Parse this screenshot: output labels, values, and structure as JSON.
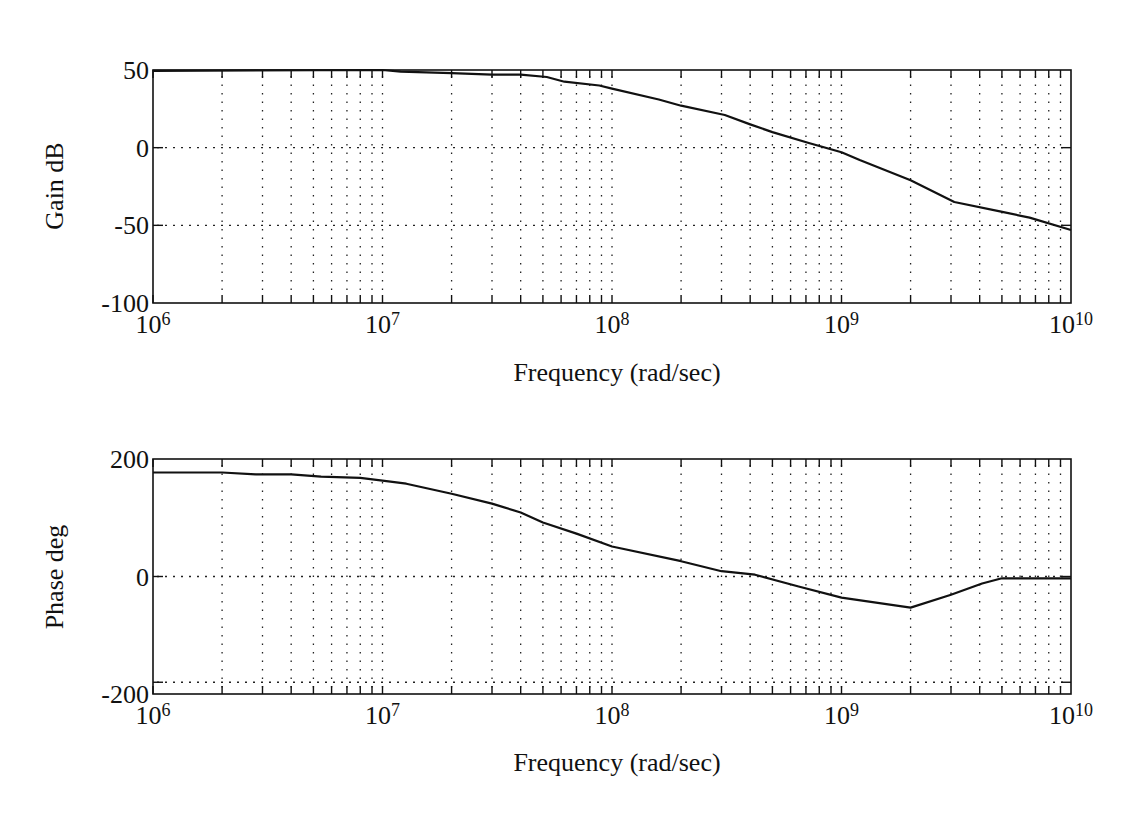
{
  "chart_data": [
    {
      "type": "line",
      "title": "",
      "xlabel": "Frequency (rad/sec)",
      "ylabel": "Gain dB",
      "xscale": "log",
      "xlim": [
        1000000,
        10000000000
      ],
      "ylim": [
        -100,
        50
      ],
      "xticks": [
        {
          "base": "10",
          "exp": "6"
        },
        {
          "base": "10",
          "exp": "7"
        },
        {
          "base": "10",
          "exp": "8"
        },
        {
          "base": "10",
          "exp": "9"
        },
        {
          "base": "10",
          "exp": "10"
        }
      ],
      "yticks": [
        "50",
        "0",
        "-50",
        "-100"
      ],
      "grid": true,
      "series": [
        {
          "name": "Gain",
          "x": [
            1000000.0,
            10000000.0,
            12000000.0,
            20000000.0,
            30000000.0,
            40000000.0,
            52000000.0,
            62000000.0,
            88000000.0,
            100000000.0,
            160000000.0,
            200000000.0,
            310000000.0,
            400000000.0,
            500000000.0,
            720000000.0,
            1000000000.0,
            1200000000.0,
            2000000000.0,
            3100000000.0,
            4900000000.0,
            6600000000.0,
            10000000000.0
          ],
          "values": [
            49.5,
            50,
            49,
            48,
            47,
            47,
            45.5,
            42.5,
            40,
            38,
            31,
            27,
            21,
            15,
            10,
            3,
            -3,
            -8,
            -21,
            -35,
            -41,
            -45,
            -53
          ]
        }
      ]
    },
    {
      "type": "line",
      "title": "",
      "xlabel": "Frequency (rad/sec)",
      "ylabel": "Phase deg",
      "xscale": "log",
      "xlim": [
        1000000,
        10000000000
      ],
      "ylim": [
        -200,
        200
      ],
      "xticks": [
        {
          "base": "10",
          "exp": "6"
        },
        {
          "base": "10",
          "exp": "7"
        },
        {
          "base": "10",
          "exp": "8"
        },
        {
          "base": "10",
          "exp": "9"
        },
        {
          "base": "10",
          "exp": "10"
        }
      ],
      "yticks": [
        "200",
        "0",
        "-200"
      ],
      "reference_lines": [
        0,
        -180
      ],
      "grid": true,
      "series": [
        {
          "name": "Phase",
          "x": [
            1000000.0,
            2000000.0,
            2800000.0,
            4000000.0,
            5400000.0,
            8000000.0,
            10000000.0,
            12700000.0,
            20000000.0,
            30000000.0,
            40000000.0,
            50000000.0,
            70000000.0,
            100000000.0,
            200000000.0,
            300000000.0,
            420000000.0,
            650000000.0,
            1000000000.0,
            2000000000.0,
            3000000000.0,
            4100000000.0,
            5000000000.0,
            10000000000.0
          ],
          "values": [
            177,
            177,
            174,
            174,
            170,
            168,
            163,
            158,
            141,
            124,
            109,
            92,
            73,
            51,
            26,
            9,
            3,
            -17,
            -36,
            -53,
            -31,
            -12,
            -3,
            -3
          ]
        }
      ]
    }
  ]
}
